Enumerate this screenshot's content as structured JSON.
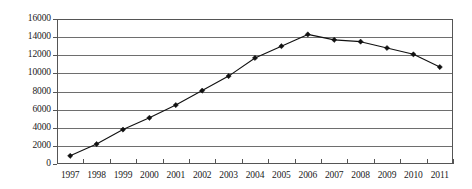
{
  "chart_data": {
    "type": "line",
    "title": "",
    "subtitle": "",
    "xlabel": "",
    "ylabel": "",
    "categories": [
      "1997",
      "1998",
      "1999",
      "2000",
      "2001",
      "2002",
      "2003",
      "2004",
      "2005",
      "2006",
      "2007",
      "2008",
      "2009",
      "2010",
      "2011"
    ],
    "values": [
      900,
      2200,
      3800,
      5100,
      6500,
      8100,
      9700,
      11700,
      13000,
      14300,
      13700,
      13500,
      12800,
      12100,
      10700
    ],
    "series": [
      {
        "name": "series-1",
        "values": [
          900,
          2200,
          3800,
          5100,
          6500,
          8100,
          9700,
          11700,
          13000,
          14300,
          13700,
          13500,
          12800,
          12100,
          10700
        ]
      }
    ],
    "ylim": [
      0,
      16000
    ],
    "yticks": [
      0,
      2000,
      4000,
      6000,
      8000,
      10000,
      12000,
      14000,
      16000
    ],
    "ytick_labels": [
      "0",
      "2000",
      "4000",
      "6000",
      "8000",
      "10000",
      "12000",
      "14000",
      "16000"
    ],
    "xticks": [
      "1997",
      "1998",
      "1999",
      "2000",
      "2001",
      "2002",
      "2003",
      "2004",
      "2005",
      "2006",
      "2007",
      "2008",
      "2009",
      "2010",
      "2011"
    ],
    "grid": true,
    "grid_axis": "y",
    "legend": false,
    "legend_position": "none",
    "marker": "diamond",
    "line_color": "#111111",
    "marker_color": "#111111",
    "grid_color": "#6e6e6e",
    "axis_color": "#555555",
    "background_color": "#ffffff",
    "annotations": []
  }
}
